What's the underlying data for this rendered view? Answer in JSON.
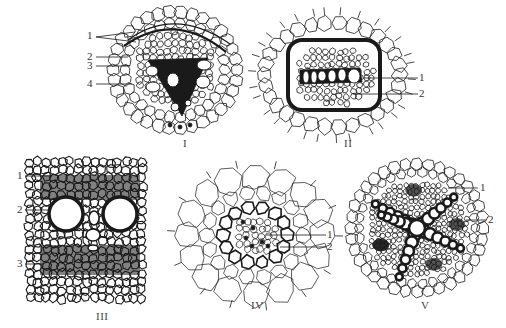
{
  "figure": {
    "panels": [
      {
        "id": "I",
        "caption": "I",
        "labels": [
          "1",
          "1",
          "2",
          "3",
          "4"
        ]
      },
      {
        "id": "II",
        "caption": "II",
        "labels": [
          "1",
          "2"
        ]
      },
      {
        "id": "III",
        "caption": "III",
        "labels": [
          "1",
          "2",
          "3"
        ]
      },
      {
        "id": "IV",
        "caption": "IV",
        "labels": [
          "1",
          "2"
        ]
      },
      {
        "id": "V",
        "caption": "V",
        "labels": [
          "1",
          "2"
        ]
      }
    ],
    "colors": {
      "ink": "#1a1a1a",
      "background": "#ffffff"
    }
  }
}
